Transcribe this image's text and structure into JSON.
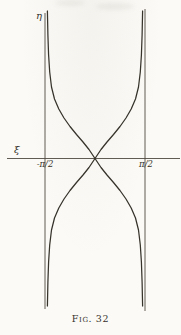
{
  "figure": {
    "caption": "Fig. 32"
  },
  "colors": {
    "paper": "#fbfaf6",
    "ink": "#36332b",
    "rule": "#4e4a41"
  },
  "chart_data": {
    "type": "line",
    "title": "Fig. 32",
    "xlabel": "ξ",
    "ylabel": "η",
    "xlim": [
      -2.77,
      2.67
    ],
    "ylim": [
      -4.85,
      4.7
    ],
    "grid": false,
    "legend": "none",
    "x_ticks": [
      {
        "value": -1.5708,
        "label": "-π/2"
      },
      {
        "value": 1.5708,
        "label": "π/2"
      }
    ],
    "asymptotes": [
      {
        "x": -1.5708,
        "label": "-π/2"
      },
      {
        "x": 1.5708,
        "label": "π/2"
      }
    ],
    "series": [
      {
        "name": "descending-branch",
        "points": [
          [
            -1.495,
            4.634
          ],
          [
            -1.48,
            3.88
          ],
          [
            -1.458,
            3.251
          ],
          [
            -1.423,
            2.717
          ],
          [
            -1.366,
            2.246
          ],
          [
            -1.272,
            1.869
          ],
          [
            -1.137,
            1.555
          ],
          [
            -0.974,
            1.272
          ],
          [
            -0.785,
            1.005
          ],
          [
            -0.581,
            0.754
          ],
          [
            -0.377,
            0.518
          ],
          [
            -0.188,
            0.283
          ],
          [
            0,
            0
          ],
          [
            0.188,
            -0.283
          ],
          [
            0.377,
            -0.518
          ],
          [
            0.581,
            -0.754
          ],
          [
            0.785,
            -1.005
          ],
          [
            0.974,
            -1.272
          ],
          [
            1.137,
            -1.555
          ],
          [
            1.272,
            -1.869
          ],
          [
            1.366,
            -2.246
          ],
          [
            1.423,
            -2.717
          ],
          [
            1.458,
            -3.251
          ],
          [
            1.48,
            -3.88
          ],
          [
            1.495,
            -4.634
          ]
        ]
      },
      {
        "name": "ascending-branch",
        "points": [
          [
            -1.495,
            -4.634
          ],
          [
            -1.48,
            -3.88
          ],
          [
            -1.458,
            -3.251
          ],
          [
            -1.423,
            -2.717
          ],
          [
            -1.366,
            -2.246
          ],
          [
            -1.272,
            -1.869
          ],
          [
            -1.137,
            -1.555
          ],
          [
            -0.974,
            -1.272
          ],
          [
            -0.785,
            -1.005
          ],
          [
            -0.581,
            -0.754
          ],
          [
            -0.377,
            -0.518
          ],
          [
            -0.188,
            -0.283
          ],
          [
            0,
            0
          ],
          [
            0.188,
            0.283
          ],
          [
            0.377,
            0.518
          ],
          [
            0.581,
            0.754
          ],
          [
            0.785,
            1.005
          ],
          [
            0.974,
            1.272
          ],
          [
            1.137,
            1.555
          ],
          [
            1.272,
            1.869
          ],
          [
            1.366,
            2.246
          ],
          [
            1.423,
            2.717
          ],
          [
            1.458,
            3.251
          ],
          [
            1.48,
            3.88
          ],
          [
            1.495,
            4.634
          ]
        ]
      }
    ]
  }
}
